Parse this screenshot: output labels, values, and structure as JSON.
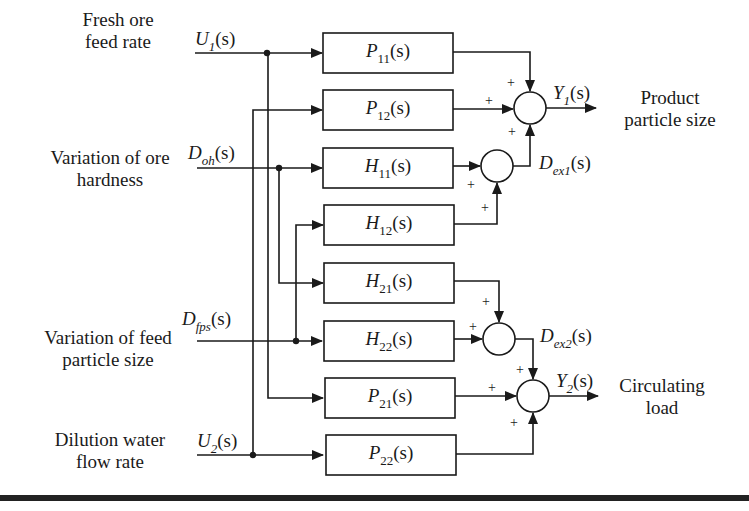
{
  "inputs": [
    {
      "id": "u1",
      "label_line1": "Fresh ore",
      "label_line2": "feed rate",
      "signal": "U",
      "sub": "1",
      "arg": "(s)"
    },
    {
      "id": "doh",
      "label_line1": "Variation of ore",
      "label_line2": "hardness",
      "signal": "D",
      "sub": "oh",
      "arg": "(s)"
    },
    {
      "id": "dfps",
      "label_line1": "Variation of feed",
      "label_line2": "particle size",
      "signal": "D",
      "sub": "fps",
      "arg": "(s)"
    },
    {
      "id": "u2",
      "label_line1": "Dilution water",
      "label_line2": "flow rate",
      "signal": "U",
      "sub": "2",
      "arg": "(s)"
    }
  ],
  "blocks": [
    {
      "id": "p11",
      "name": "P",
      "sub": "11",
      "arg": "(s)"
    },
    {
      "id": "p12",
      "name": "P",
      "sub": "12",
      "arg": "(s)"
    },
    {
      "id": "h11",
      "name": "H",
      "sub": "11",
      "arg": "(s)"
    },
    {
      "id": "h12",
      "name": "H",
      "sub": "12",
      "arg": "(s)"
    },
    {
      "id": "h21",
      "name": "H",
      "sub": "21",
      "arg": "(s)"
    },
    {
      "id": "h22",
      "name": "H",
      "sub": "22",
      "arg": "(s)"
    },
    {
      "id": "p21",
      "name": "P",
      "sub": "21",
      "arg": "(s)"
    },
    {
      "id": "p22",
      "name": "P",
      "sub": "22",
      "arg": "(s)"
    }
  ],
  "intermediate": [
    {
      "id": "dex1",
      "signal": "D",
      "sub": "ex1",
      "arg": "(s)"
    },
    {
      "id": "dex2",
      "signal": "D",
      "sub": "ex2",
      "arg": "(s)"
    }
  ],
  "outputs": [
    {
      "id": "y1",
      "signal": "Y",
      "sub": "1",
      "arg": "(s)",
      "label_line1": "Product",
      "label_line2": "particle size"
    },
    {
      "id": "y2",
      "signal": "Y",
      "sub": "2",
      "arg": "(s)",
      "label_line1": "Circulating",
      "label_line2": "load"
    }
  ],
  "sign": "+",
  "colors": {
    "line": "#1a1a1a",
    "background": "#ffffff"
  }
}
